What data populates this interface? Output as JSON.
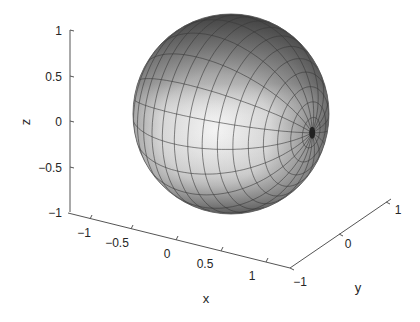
{
  "chart_data": {
    "type": "surface3d",
    "title": "",
    "surface": "unit sphere",
    "equation": "x^2 + y^2 + z^2 = 1",
    "colormap": "gray",
    "grid": false,
    "mesh": {
      "longitude_lines": 20,
      "latitude_lines": 20
    },
    "xlabel": "x",
    "ylabel": "y",
    "zlabel": "z",
    "xlim": [
      -1,
      1
    ],
    "ylim": [
      -1,
      1
    ],
    "zlim": [
      -1,
      1
    ],
    "xticks": [
      "-1",
      "-0.5",
      "0",
      "0.5",
      "1"
    ],
    "yticks": [
      "-1",
      "0",
      "1"
    ],
    "zticks": [
      "-1",
      "-0.5",
      "0",
      "0.5",
      "1"
    ]
  },
  "labels": {
    "x": "x",
    "y": "y",
    "z": "z",
    "xticks": [
      "−1",
      "−0.5",
      "0",
      "0.5",
      "1"
    ],
    "yticks": [
      "−1",
      "0",
      "1"
    ],
    "zticks": [
      "1",
      "0.5",
      "0",
      "−0.5",
      "−1"
    ]
  },
  "colors": {
    "axis": "#555555",
    "text": "#262626",
    "mesh": "#3a3a3a",
    "shade_light": "#f2f2f2",
    "shade_mid": "#b8b8b8",
    "shade_dark": "#4a4a4a"
  }
}
